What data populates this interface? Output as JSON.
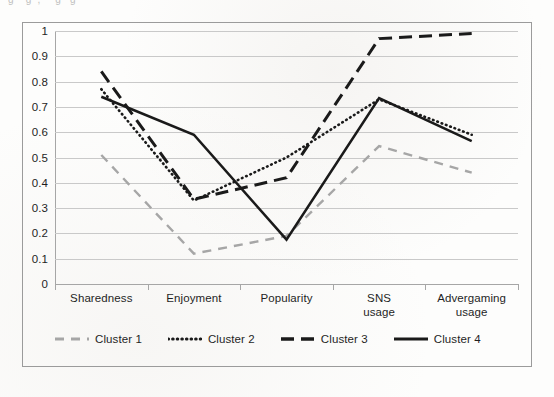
{
  "caption_sliver": "g  ­  ­  ­   g  ­ , ­  ­ ­  ­ g ­ ­ g",
  "chart_data": {
    "type": "line",
    "title": "",
    "xlabel": "",
    "ylabel": "",
    "categories": [
      "Sharedness",
      "Enjoyment",
      "Popularity",
      "SNS usage",
      "Advergaming usage"
    ],
    "category_labels": [
      {
        "line1": "Sharedness",
        "line2": ""
      },
      {
        "line1": "Enjoyment",
        "line2": ""
      },
      {
        "line1": "Popularity",
        "line2": ""
      },
      {
        "line1": "SNS",
        "line2": "usage"
      },
      {
        "line1": "Advergaming",
        "line2": "usage"
      }
    ],
    "ylim": [
      0,
      1
    ],
    "ytick_labels": [
      "1",
      "0.9",
      "0.8",
      "0.7",
      "0.6",
      "0.5",
      "0.4",
      "0.3",
      "0.2",
      "0.1",
      "0"
    ],
    "ytick_values": [
      1,
      0.9,
      0.8,
      0.7,
      0.6,
      0.5,
      0.4,
      0.3,
      0.2,
      0.1,
      0
    ],
    "grid": true,
    "legend_position": "bottom",
    "series": [
      {
        "name": "Cluster 1",
        "style": "dashed",
        "color": "#a6a6a6",
        "width": 2.4,
        "dash": "9,7",
        "values": [
          0.51,
          0.12,
          0.19,
          0.545,
          0.44
        ]
      },
      {
        "name": "Cluster 2",
        "style": "dotted",
        "color": "#1a1a1a",
        "width": 2.6,
        "dash": "0.6,4",
        "values": [
          0.77,
          0.33,
          0.5,
          0.73,
          0.59
        ]
      },
      {
        "name": "Cluster 3",
        "style": "long-dashed",
        "color": "#1a1a1a",
        "width": 3.0,
        "dash": "13,7",
        "values": [
          0.84,
          0.335,
          0.42,
          0.97,
          0.99
        ]
      },
      {
        "name": "Cluster 4",
        "style": "solid",
        "color": "#1a1a1a",
        "width": 2.6,
        "dash": "none",
        "values": [
          0.74,
          0.59,
          0.175,
          0.735,
          0.565
        ]
      }
    ]
  }
}
